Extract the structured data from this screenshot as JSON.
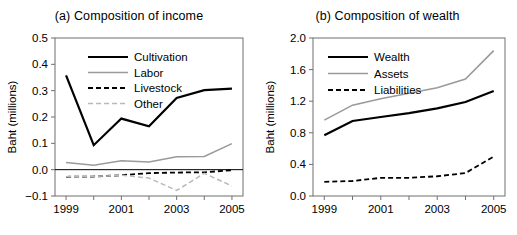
{
  "figure": {
    "width": 517,
    "height": 235,
    "background": "#ffffff"
  },
  "chart_data": [
    {
      "type": "line",
      "panel": "a",
      "title": "(a) Composition of income",
      "xlabel": "",
      "ylabel": "Baht (millions)",
      "x": [
        1999,
        2000,
        2001,
        2002,
        2003,
        2004,
        2005
      ],
      "xlim": [
        1998.6,
        2005.4
      ],
      "ylim": [
        -0.1,
        0.5
      ],
      "xticks": [
        1999,
        2000,
        2001,
        2002,
        2003,
        2004,
        2005
      ],
      "xticklabels": [
        "1999",
        "",
        "2001",
        "",
        "2003",
        "",
        "2005"
      ],
      "yticks": [
        -0.1,
        0.0,
        0.1,
        0.2,
        0.3,
        0.4,
        0.5
      ],
      "yticklabels": [
        "−0.1",
        "0.0",
        "0.1",
        "0.2",
        "0.3",
        "0.4",
        "0.5"
      ],
      "grid": false,
      "zero_line": true,
      "legend_position": "top-center",
      "series": [
        {
          "name": "Cultivation",
          "values": [
            0.358,
            0.093,
            0.194,
            0.165,
            0.272,
            0.302,
            0.308
          ],
          "color": "#000000",
          "width": 2.2,
          "dash": "none"
        },
        {
          "name": "Labor",
          "values": [
            0.027,
            0.017,
            0.034,
            0.029,
            0.049,
            0.05,
            0.099
          ],
          "color": "#9a9a9a",
          "width": 1.6,
          "dash": "none"
        },
        {
          "name": "Livestock",
          "values": [
            -0.027,
            -0.026,
            -0.021,
            -0.013,
            -0.011,
            -0.01,
            -0.002
          ],
          "color": "#000000",
          "width": 1.8,
          "dash": "5,3"
        },
        {
          "name": "Other",
          "values": [
            -0.027,
            -0.026,
            -0.021,
            -0.032,
            -0.079,
            -0.014,
            -0.062
          ],
          "color": "#b9b9b9",
          "width": 1.5,
          "dash": "5,3"
        }
      ]
    },
    {
      "type": "line",
      "panel": "b",
      "title": "(b) Composition of wealth",
      "xlabel": "",
      "ylabel": "Baht (millions)",
      "x": [
        1999,
        2000,
        2001,
        2002,
        2003,
        2004,
        2005
      ],
      "xlim": [
        1998.6,
        2005.4
      ],
      "ylim": [
        0.0,
        2.0
      ],
      "xticks": [
        1999,
        2000,
        2001,
        2002,
        2003,
        2004,
        2005
      ],
      "xticklabels": [
        "1999",
        "",
        "2001",
        "",
        "2003",
        "",
        "2005"
      ],
      "yticks": [
        0.0,
        0.4,
        0.8,
        1.2,
        1.6,
        2.0
      ],
      "yticklabels": [
        "0.0",
        "0.4",
        "0.8",
        "1.2",
        "1.6",
        "2.0"
      ],
      "grid": false,
      "zero_line": false,
      "legend_position": "top-left",
      "series": [
        {
          "name": "Wealth",
          "values": [
            0.77,
            0.95,
            1.0,
            1.05,
            1.11,
            1.19,
            1.33
          ],
          "color": "#000000",
          "width": 2.2,
          "dash": "none"
        },
        {
          "name": "Assets",
          "values": [
            0.96,
            1.15,
            1.23,
            1.3,
            1.37,
            1.48,
            1.84
          ],
          "color": "#9a9a9a",
          "width": 1.6,
          "dash": "none"
        },
        {
          "name": "Liabilities",
          "values": [
            0.18,
            0.19,
            0.23,
            0.23,
            0.25,
            0.29,
            0.5
          ],
          "color": "#000000",
          "width": 1.8,
          "dash": "5,3"
        }
      ]
    }
  ]
}
